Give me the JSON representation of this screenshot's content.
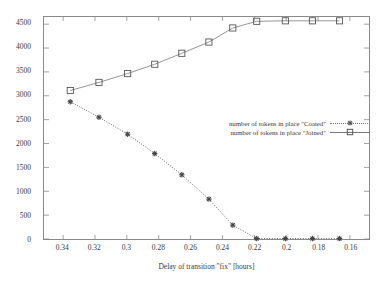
{
  "chart_data": {
    "type": "line",
    "title": "",
    "xlabel": "Delay of transition \"fix\" [hours]",
    "ylabel": "",
    "xlim": [
      0.352,
      0.148
    ],
    "ylim": [
      0,
      4650
    ],
    "x_reversed": true,
    "grid": false,
    "legend_position": "center-right",
    "xticks": [
      0.34,
      0.32,
      0.3,
      0.28,
      0.26,
      0.24,
      0.22,
      0.2,
      0.18,
      0.16
    ],
    "xtick_labels": [
      "0.34",
      "0.32",
      "0.3",
      "0.28",
      "0.26",
      "0.24",
      "0.22",
      "0.2",
      "0.18",
      "0.16"
    ],
    "yticks": [
      0,
      500,
      1000,
      1500,
      2000,
      2500,
      3000,
      3500,
      4000,
      4500
    ],
    "ytick_labels": [
      "0",
      "500",
      "1000",
      "1500",
      "2000",
      "2500",
      "3000",
      "3500",
      "4000",
      "4500"
    ],
    "x": [
      0.3355,
      0.3175,
      0.2995,
      0.2825,
      0.2655,
      0.2485,
      0.2335,
      0.2185,
      0.2005,
      0.1835,
      0.1665
    ],
    "series": [
      {
        "name": "number of tokens in place \"Coated\"",
        "marker": "asterisk",
        "linestyle": "dotted",
        "color": "#555555",
        "values": [
          2875,
          2550,
          2195,
          1790,
          1345,
          835,
          290,
          10,
          10,
          10,
          10
        ]
      },
      {
        "name": "number of tokens in place \"Joined\"",
        "marker": "square",
        "linestyle": "solid",
        "color": "#888888",
        "values": [
          3110,
          3280,
          3465,
          3660,
          3890,
          4125,
          4420,
          4560,
          4570,
          4570,
          4570
        ]
      }
    ]
  },
  "legend": {
    "entries": [
      {
        "label": "number of tokens in place \"Coated\""
      },
      {
        "label": "number of tokens in place \"Joined\""
      }
    ]
  },
  "colors": {
    "frame": "#8a8a8a",
    "text": "#3a3a3a",
    "coated": "#555555",
    "joined": "#888888",
    "background": "#ffffff"
  }
}
